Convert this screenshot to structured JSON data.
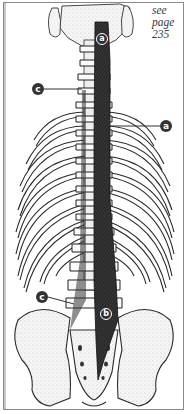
{
  "figure": {
    "reference": {
      "lines": [
        "see",
        "page",
        "235"
      ]
    },
    "labels": [
      {
        "id": "a-top",
        "text": "a",
        "x": 99,
        "y": 34,
        "style": "outline-on-muscle"
      },
      {
        "id": "c-top",
        "text": "c",
        "x": 32,
        "y": 83,
        "style": "filled"
      },
      {
        "id": "a-right",
        "text": "a",
        "x": 160,
        "y": 120,
        "style": "filled"
      },
      {
        "id": "c-bottom",
        "text": "c",
        "x": 36,
        "y": 291,
        "style": "filled"
      },
      {
        "id": "b",
        "text": "b",
        "x": 102,
        "y": 310,
        "style": "outline-on-muscle"
      }
    ],
    "colors": {
      "frame": "#8a8a8a",
      "ink": "#1e1e1e",
      "muscle": "#2b2b2b",
      "bone_fill": "#f4f4f4",
      "bone_stipple": "#bdbdbd",
      "label_fill": "#333333",
      "label_text": "#ffffff"
    }
  }
}
